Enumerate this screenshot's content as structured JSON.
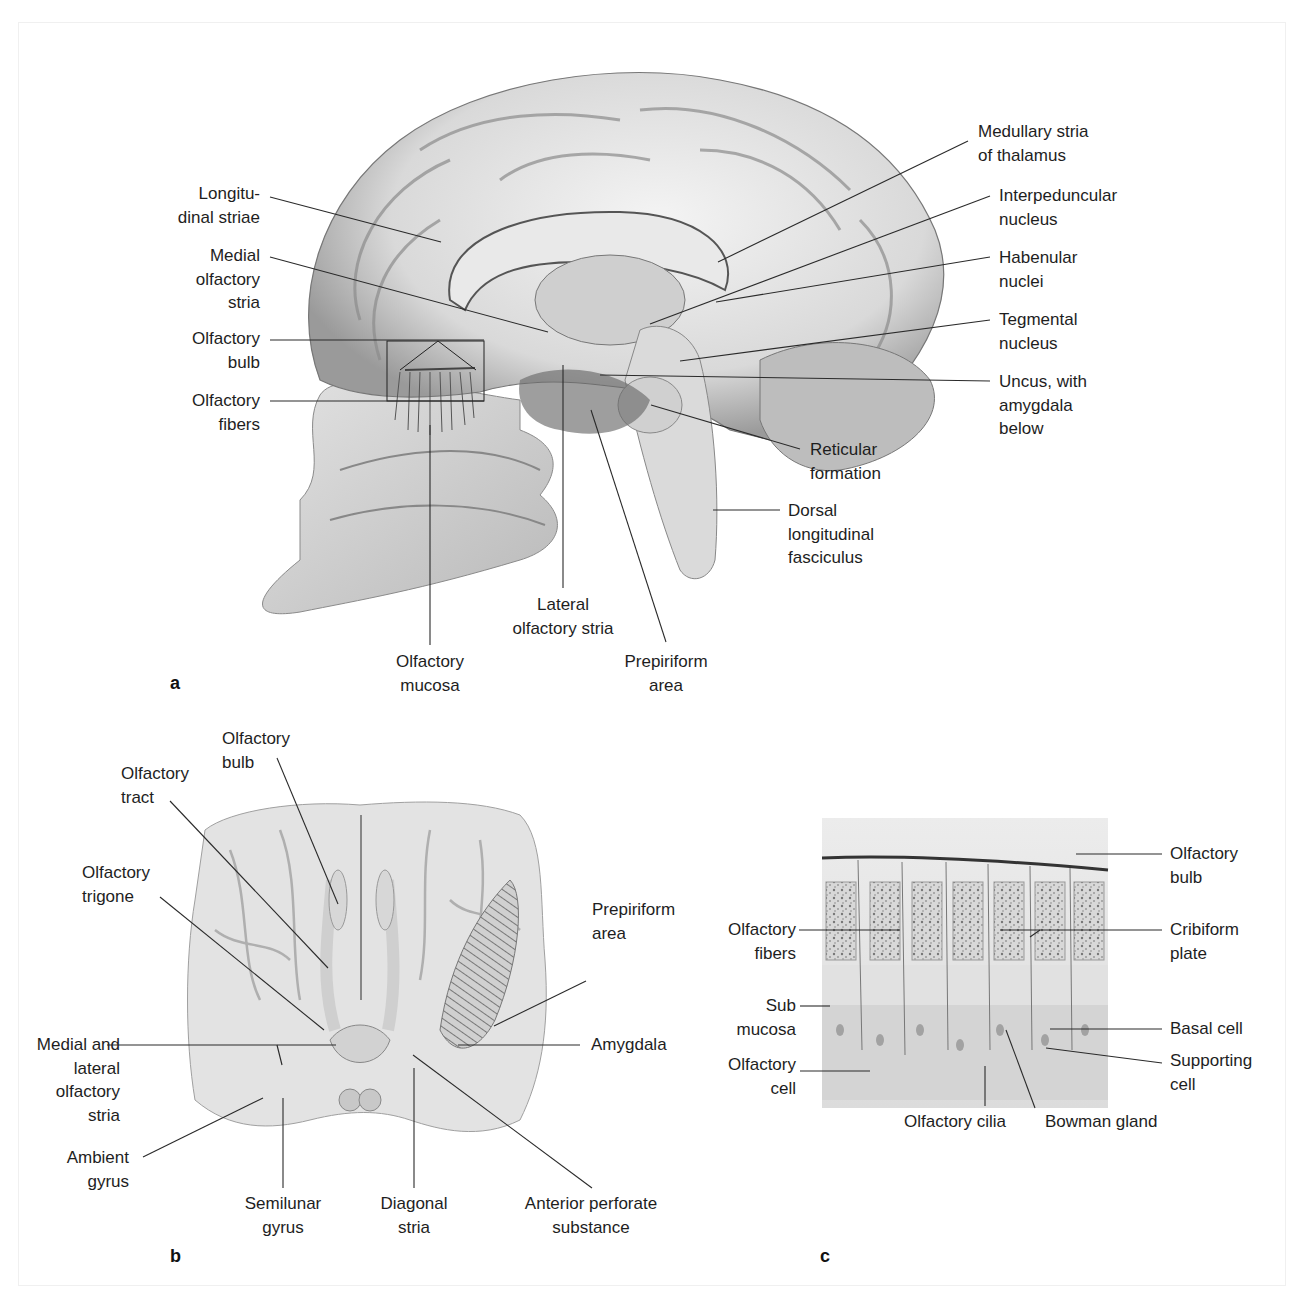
{
  "figure": {
    "panels": [
      {
        "id": "a",
        "letter": "a",
        "view": "Midsagittal section of head showing olfactory pathways",
        "labels": {
          "longitudinal_striae": [
            "Longitu-",
            "dinal striae"
          ],
          "medial_olfactory_stria": [
            "Medial",
            "olfactory",
            "stria"
          ],
          "olfactory_bulb": [
            "Olfactory",
            "bulb"
          ],
          "olfactory_fibers": [
            "Olfactory",
            "fibers"
          ],
          "medullary_stria": [
            "Medullary stria",
            "of thalamus"
          ],
          "interpeduncular_nucleus": [
            "Interpeduncular",
            "nucleus"
          ],
          "habenular_nuclei": [
            "Habenular",
            "nuclei"
          ],
          "tegmental_nucleus": [
            "Tegmental",
            "nucleus"
          ],
          "uncus": [
            "Uncus, with",
            "amygdala",
            "below"
          ],
          "reticular_formation": [
            "Reticular",
            "formation"
          ],
          "dorsal_longitudinal_fasciculus": [
            "Dorsal",
            "longitudinal",
            "fasciculus"
          ],
          "lateral_olfactory_stria": [
            "Lateral",
            "olfactory stria"
          ],
          "olfactory_mucosa": [
            "Olfactory",
            "mucosa"
          ],
          "prepiriform_area": [
            "Prepiriform",
            "area"
          ]
        }
      },
      {
        "id": "b",
        "letter": "b",
        "view": "Basal view of the brain (olfactory structures)",
        "labels": {
          "olfactory_bulb": [
            "Olfactory",
            "bulb"
          ],
          "olfactory_tract": [
            "Olfactory",
            "tract"
          ],
          "olfactory_trigone": [
            "Olfactory",
            "trigone"
          ],
          "prepiriform_area": [
            "Prepiriform",
            "area"
          ],
          "medial_lateral_stria": [
            "Medial and",
            "lateral",
            "olfactory",
            "stria"
          ],
          "amygdala": [
            "Amygdala"
          ],
          "ambient_gyrus": [
            "Ambient",
            "gyrus"
          ],
          "semilunar_gyrus": [
            "Semilunar",
            "gyrus"
          ],
          "diagonal_stria": [
            "Diagonal",
            "stria"
          ],
          "anterior_perforate_substance": [
            "Anterior perforate",
            "substance"
          ]
        }
      },
      {
        "id": "c",
        "letter": "c",
        "view": "Histological section of olfactory mucosa",
        "labels": {
          "olfactory_bulb": [
            "Olfactory",
            "bulb"
          ],
          "olfactory_fibers": [
            "Olfactory",
            "fibers"
          ],
          "cribiform_plate": [
            "Cribiform",
            "plate"
          ],
          "sub_mucosa": [
            "Sub",
            "mucosa"
          ],
          "basal_cell": [
            "Basal cell"
          ],
          "olfactory_cell": [
            "Olfactory",
            "cell"
          ],
          "supporting_cell": [
            "Supporting",
            "cell"
          ],
          "olfactory_cilia": [
            "Olfactory cilia"
          ],
          "bowman_gland": [
            "Bowman gland"
          ]
        }
      }
    ],
    "colors": {
      "line": "#2a2a2a",
      "tissue_light": "#e6e6e6",
      "tissue_mid": "#c4c4c4",
      "tissue_dark": "#6e6e6e"
    }
  }
}
